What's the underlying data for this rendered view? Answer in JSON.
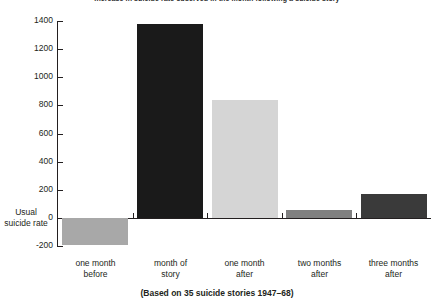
{
  "chart_data": {
    "type": "bar",
    "title": "Increase in suicide rate observed in the month following a suicide story",
    "subtitle": "",
    "footnote": "(Based on 35 suicide stories 1947–68)",
    "xlabel": "",
    "ylabel": "",
    "categories": [
      "one month\nbefore",
      "month of\nstory",
      "one month\nafter",
      "two months\nafter",
      "three months\nafter"
    ],
    "category_lines": [
      [
        "one month",
        "before"
      ],
      [
        "month of",
        "story"
      ],
      [
        "one month",
        "after"
      ],
      [
        "two months",
        "after"
      ],
      [
        "three months",
        "after"
      ]
    ],
    "values": [
      -190,
      1380,
      840,
      55,
      170
    ],
    "bar_colors": [
      "#a8a8a8",
      "#1a1a1a",
      "#d5d5d5",
      "#808080",
      "#3a3a3a"
    ],
    "ylim": [
      -200,
      1400
    ],
    "yticks": [
      1400,
      1200,
      1000,
      800,
      600,
      400,
      200,
      0,
      -200
    ],
    "ytick_labels": [
      "1400",
      "1200",
      "1000",
      "800",
      "600",
      "400",
      "200",
      "0",
      "-200"
    ],
    "grid": false,
    "legend": "none",
    "baseline_annotation": [
      "Usual",
      "suicide rate"
    ],
    "baseline_value": 0
  }
}
